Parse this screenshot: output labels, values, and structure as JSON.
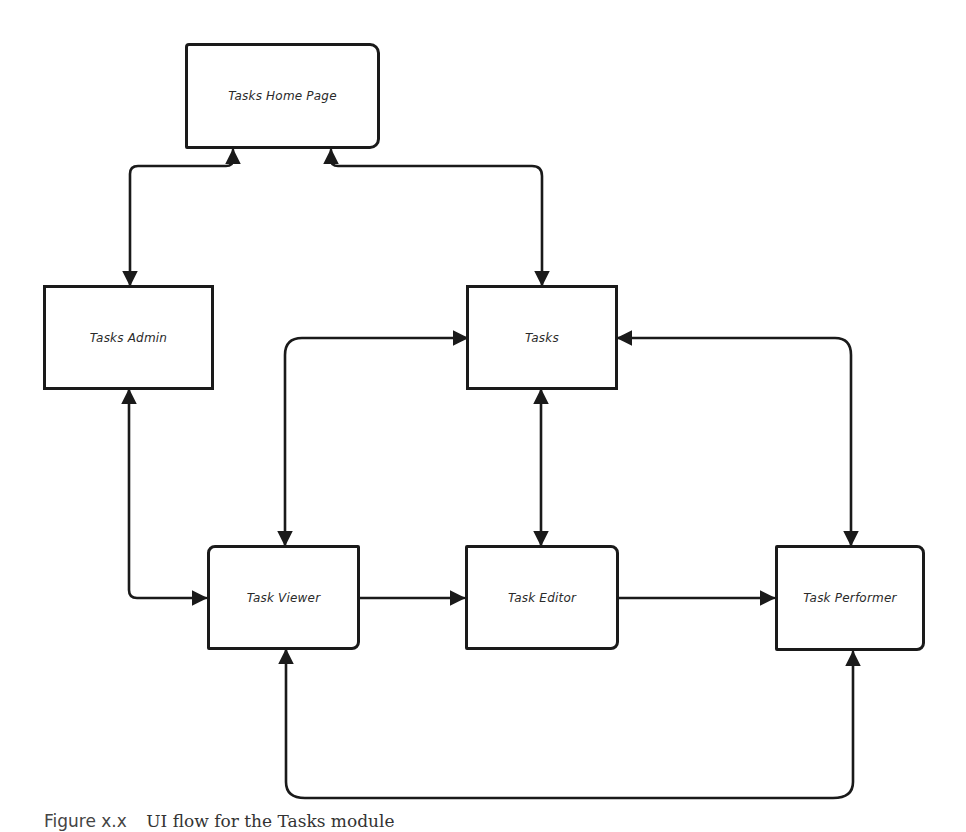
{
  "diagram": {
    "nodes": [
      {
        "id": "home",
        "label": "Tasks Home Page"
      },
      {
        "id": "admin",
        "label": "Tasks Admin"
      },
      {
        "id": "tasks",
        "label": "Tasks"
      },
      {
        "id": "viewer",
        "label": "Task Viewer"
      },
      {
        "id": "editor",
        "label": "Task Editor"
      },
      {
        "id": "performer",
        "label": "Task Performer"
      }
    ],
    "edges": [
      {
        "from": "home",
        "to": "admin",
        "direction": "both"
      },
      {
        "from": "home",
        "to": "tasks",
        "direction": "both"
      },
      {
        "from": "tasks",
        "to": "viewer",
        "direction": "both"
      },
      {
        "from": "tasks",
        "to": "editor",
        "direction": "both"
      },
      {
        "from": "tasks",
        "to": "performer",
        "direction": "both"
      },
      {
        "from": "admin",
        "to": "viewer",
        "direction": "both"
      },
      {
        "from": "viewer",
        "to": "editor",
        "direction": "forward"
      },
      {
        "from": "editor",
        "to": "performer",
        "direction": "forward"
      },
      {
        "from": "viewer",
        "to": "performer",
        "direction": "both"
      }
    ],
    "stroke_color": "#1a1a1a"
  },
  "caption": {
    "label": "Figure x.x",
    "text": "UI flow for the Tasks module"
  }
}
